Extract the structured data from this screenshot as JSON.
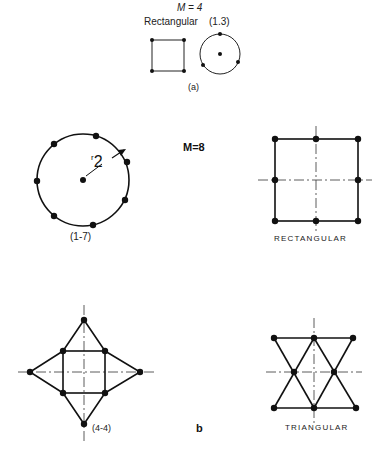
{
  "top_panel": {
    "title": "M = 4",
    "left_label": "Rectangular",
    "right_label": "(1.3)",
    "caption": "(a)"
  },
  "bottom_panel": {
    "title": "M=8",
    "caption": "b",
    "circle": {
      "label": "(1-7)",
      "radius_label_r": "r",
      "radius_label_sub": "2"
    },
    "rectangular": {
      "label": "RECTANGULAR"
    },
    "star": {
      "label": "(4-4)"
    },
    "triangular": {
      "label": "TRIANGULAR"
    }
  },
  "colors": {
    "ink": "#111111",
    "background": "#ffffff"
  }
}
